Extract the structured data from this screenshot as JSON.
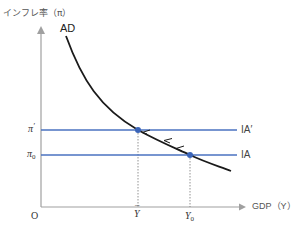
{
  "diagram": {
    "y_axis_label": "インフレ率（π）",
    "x_axis_label": "GDP（Y）",
    "origin_label": "O",
    "curves": {
      "ad": {
        "label": "AD",
        "color": "#1a1a1a"
      },
      "ia_prime": {
        "label": "IA′",
        "y_tick_label": "π′",
        "color": "#4a72c0"
      },
      "ia": {
        "label": "IA",
        "y_tick_label": "π0",
        "color": "#4a72c0"
      }
    },
    "y_ticks": {
      "pi_prime": {
        "symbol": "π",
        "mark": "′"
      },
      "pi_zero": {
        "symbol": "π",
        "sub": "0"
      }
    },
    "x_ticks": {
      "y_bar": {
        "symbol": "Y",
        "accent": "¯"
      },
      "y_zero": {
        "symbol": "Y",
        "sub": "0"
      }
    },
    "points": [
      {
        "name": "equilibrium-new",
        "x_tick": "Ȳ",
        "y_tick": "π′"
      },
      {
        "name": "equilibrium-initial",
        "x_tick": "Y0",
        "y_tick": "π0"
      }
    ],
    "axis_color": "#999999",
    "dot_color": "#3a64b8",
    "movement_direction": "up-left along AD"
  }
}
